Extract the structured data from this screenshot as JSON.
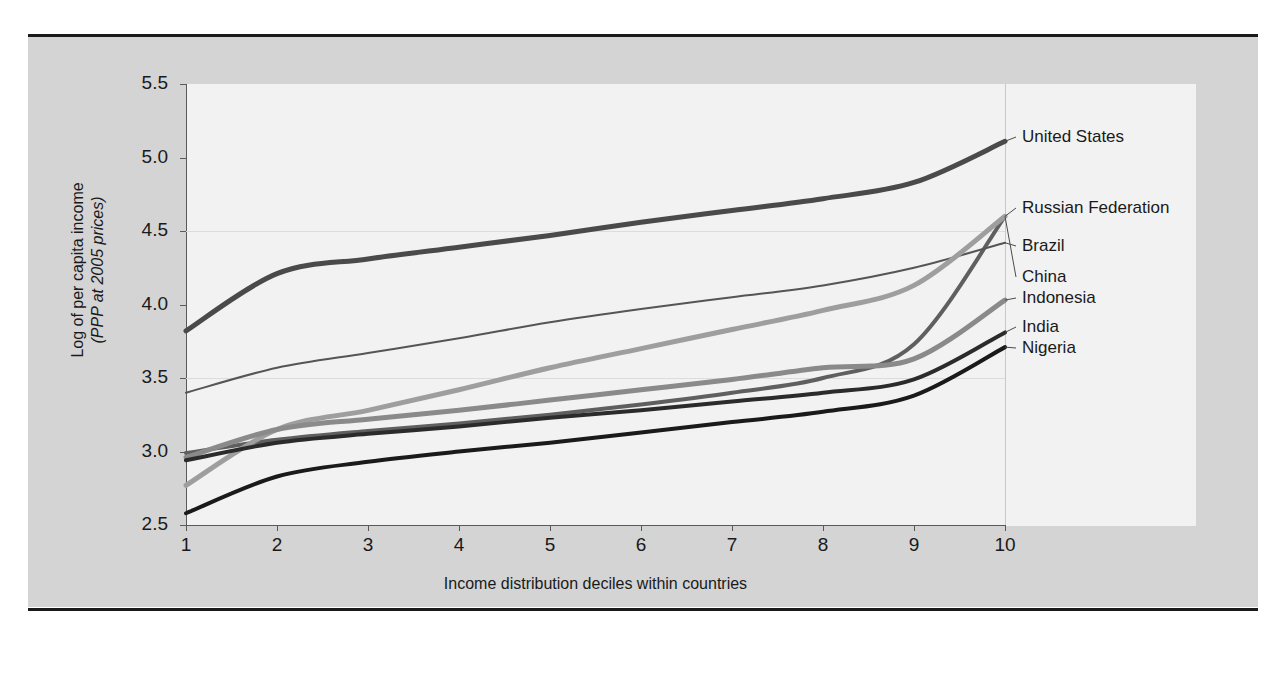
{
  "figure": {
    "background_color": "#d4d4d4",
    "plot_background_color": "#f2f2f2",
    "rule_color": "#1a1a1a"
  },
  "chart_data": {
    "type": "line",
    "title": "",
    "xlabel": "Income distribution deciles within countries",
    "ylabel_line1": "Log of per capita income",
    "ylabel_line2": "(PPP at 2005 prices)",
    "x": [
      1,
      2,
      3,
      4,
      5,
      6,
      7,
      8,
      9,
      10
    ],
    "categories": [
      "1",
      "2",
      "3",
      "4",
      "5",
      "6",
      "7",
      "8",
      "9",
      "10"
    ],
    "xtick_labels": [
      "1",
      "2",
      "3",
      "4",
      "5",
      "6",
      "7",
      "8",
      "9",
      "10"
    ],
    "ytick_labels": [
      "2.5",
      "3.0",
      "3.5",
      "4.0",
      "4.5",
      "5.0",
      "5.5"
    ],
    "ytick_values": [
      2.5,
      3.0,
      3.5,
      4.0,
      4.5,
      5.0,
      5.5
    ],
    "xlim": [
      1,
      10
    ],
    "ylim": [
      2.5,
      5.5
    ],
    "grid": "horizontal-faint",
    "gridline_values": [
      3.5,
      4.5
    ],
    "legend_position": "right-inline-labels",
    "series": [
      {
        "name": "United States",
        "color": "#4a4a4a",
        "width": 5,
        "values": [
          3.82,
          4.21,
          4.31,
          4.39,
          4.47,
          4.56,
          4.64,
          4.72,
          4.83,
          5.11
        ]
      },
      {
        "name": "Russian Federation",
        "color": "#5f5f5f",
        "width": 4,
        "values": [
          2.99,
          3.08,
          3.14,
          3.19,
          3.25,
          3.32,
          3.4,
          3.5,
          3.73,
          4.6
        ]
      },
      {
        "name": "Brazil",
        "color": "#555555",
        "width": 2,
        "values": [
          3.4,
          3.57,
          3.67,
          3.77,
          3.88,
          3.97,
          4.05,
          4.13,
          4.25,
          4.42
        ]
      },
      {
        "name": "China",
        "color": "#9e9e9e",
        "width": 5,
        "values": [
          2.77,
          3.15,
          3.28,
          3.42,
          3.57,
          3.7,
          3.83,
          3.96,
          4.13,
          4.6
        ]
      },
      {
        "name": "Indonesia",
        "color": "#8a8a8a",
        "width": 5,
        "values": [
          2.96,
          3.15,
          3.22,
          3.28,
          3.35,
          3.42,
          3.49,
          3.57,
          3.63,
          4.03
        ]
      },
      {
        "name": "India",
        "color": "#2b2b2b",
        "width": 4,
        "values": [
          2.94,
          3.06,
          3.12,
          3.17,
          3.23,
          3.28,
          3.34,
          3.4,
          3.49,
          3.81
        ]
      },
      {
        "name": "Nigeria",
        "color": "#1a1a1a",
        "width": 4,
        "values": [
          2.58,
          2.83,
          2.93,
          3.0,
          3.06,
          3.13,
          3.2,
          3.27,
          3.38,
          3.71
        ]
      }
    ],
    "annotations": [
      {
        "label": "United States",
        "x": 1022,
        "y": 137
      },
      {
        "label": "Russian Federation",
        "x": 1022,
        "y": 208
      },
      {
        "label": "Brazil",
        "x": 1022,
        "y": 246
      },
      {
        "label": "China",
        "x": 1022,
        "y": 277
      },
      {
        "label": "Indonesia",
        "x": 1022,
        "y": 298
      },
      {
        "label": "India",
        "x": 1022,
        "y": 327
      },
      {
        "label": "Nigeria",
        "x": 1022,
        "y": 348
      }
    ]
  }
}
